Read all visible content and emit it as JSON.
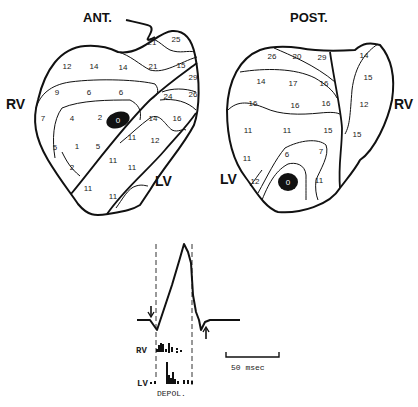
{
  "figure": {
    "anterior": {
      "title": "ANT.",
      "rv_label": "RV",
      "lv_label": "LV",
      "earliest_site_label": "0",
      "isochrone_values": [
        {
          "v": "21",
          "x": 152,
          "y": 45
        },
        {
          "v": "25",
          "x": 176,
          "y": 42
        },
        {
          "v": "12",
          "x": 67,
          "y": 69
        },
        {
          "v": "14",
          "x": 94,
          "y": 69
        },
        {
          "v": "14",
          "x": 123,
          "y": 70
        },
        {
          "v": "21",
          "x": 153,
          "y": 69
        },
        {
          "v": "15",
          "x": 181,
          "y": 68
        },
        {
          "v": "29",
          "x": 193,
          "y": 80
        },
        {
          "v": "26",
          "x": 193,
          "y": 97
        },
        {
          "v": "24",
          "x": 168,
          "y": 99
        },
        {
          "v": "9",
          "x": 57,
          "y": 95
        },
        {
          "v": "6",
          "x": 89,
          "y": 95
        },
        {
          "v": "6",
          "x": 121,
          "y": 95
        },
        {
          "v": "7",
          "x": 43,
          "y": 121
        },
        {
          "v": "4",
          "x": 72,
          "y": 121
        },
        {
          "v": "2",
          "x": 100,
          "y": 120
        },
        {
          "v": "14",
          "x": 153,
          "y": 121
        },
        {
          "v": "16",
          "x": 177,
          "y": 121
        },
        {
          "v": "5",
          "x": 55,
          "y": 150
        },
        {
          "v": "1",
          "x": 77,
          "y": 149
        },
        {
          "v": "5",
          "x": 98,
          "y": 149
        },
        {
          "v": "11",
          "x": 132,
          "y": 140
        },
        {
          "v": "12",
          "x": 155,
          "y": 143
        },
        {
          "v": "11",
          "x": 113,
          "y": 163
        },
        {
          "v": "11",
          "x": 132,
          "y": 170
        },
        {
          "v": "2",
          "x": 72,
          "y": 170
        },
        {
          "v": "11",
          "x": 88,
          "y": 191
        },
        {
          "v": "11",
          "x": 113,
          "y": 199
        }
      ]
    },
    "posterior": {
      "title": "POST.",
      "rv_label": "RV",
      "lv_label": "LV",
      "earliest_site_label": "0",
      "isochrone_values": [
        {
          "v": "26",
          "x": 272,
          "y": 59
        },
        {
          "v": "20",
          "x": 297,
          "y": 59
        },
        {
          "v": "29",
          "x": 322,
          "y": 60
        },
        {
          "v": "14",
          "x": 364,
          "y": 58
        },
        {
          "v": "14",
          "x": 261,
          "y": 84
        },
        {
          "v": "17",
          "x": 293,
          "y": 86
        },
        {
          "v": "16",
          "x": 324,
          "y": 86
        },
        {
          "v": "15",
          "x": 368,
          "y": 80
        },
        {
          "v": "16",
          "x": 253,
          "y": 106
        },
        {
          "v": "16",
          "x": 295,
          "y": 108
        },
        {
          "v": "16",
          "x": 326,
          "y": 106
        },
        {
          "v": "12",
          "x": 364,
          "y": 107
        },
        {
          "v": "11",
          "x": 248,
          "y": 133
        },
        {
          "v": "11",
          "x": 287,
          "y": 133
        },
        {
          "v": "15",
          "x": 328,
          "y": 133
        },
        {
          "v": "15",
          "x": 357,
          "y": 137
        },
        {
          "v": "6",
          "x": 287,
          "y": 157
        },
        {
          "v": "7",
          "x": 321,
          "y": 154
        },
        {
          "v": "11",
          "x": 247,
          "y": 161
        },
        {
          "v": "12",
          "x": 255,
          "y": 184
        },
        {
          "v": "11",
          "x": 319,
          "y": 183
        }
      ]
    },
    "ecg": {
      "rv_label": "RV",
      "lv_label": "LV",
      "depol_label": "DEPOL.",
      "scale_bar_label": "50 msec"
    }
  }
}
